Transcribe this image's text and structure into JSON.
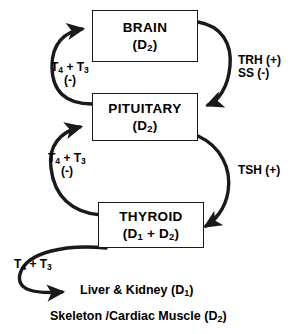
{
  "diagram": {
    "nodes": [
      {
        "id": "brain",
        "label": "BRAIN",
        "deiodinase": "(D2)",
        "deiodinase_base": "(D",
        "deiodinase_sub": "2",
        "deiodinase_tail": ")"
      },
      {
        "id": "pituitary",
        "label": "PITUITARY",
        "deiodinase": "(D2)",
        "deiodinase_base": "(D",
        "deiodinase_sub": "2",
        "deiodinase_tail": ")"
      },
      {
        "id": "thyroid",
        "label": "THYROID",
        "deiodinase": "(D1 + D2)",
        "deiodinase_base": "(D",
        "deiodinase_sub": "1",
        "deiodinase_mid": " + D",
        "deiodinase_sub2": "2",
        "deiodinase_tail": ")"
      }
    ],
    "edges": [
      {
        "id": "brain-feedback",
        "from": "pituitary",
        "to": "brain",
        "hormone_base": "T",
        "hormone_sub1": "4",
        "hormone_mid": " + T",
        "hormone_sub2": "3",
        "hormone": "T4 + T3",
        "sign": "(-)"
      },
      {
        "id": "pituitary-feedback",
        "from": "thyroid",
        "to": "pituitary",
        "hormone_base": "T",
        "hormone_sub1": "4",
        "hormone_mid": " + T",
        "hormone_sub2": "3",
        "hormone": "T4 + T3",
        "sign": "(-)"
      },
      {
        "id": "brain-to-pituitary",
        "from": "brain",
        "to": "pituitary",
        "line1": "TRH (+)",
        "line2": "SS (-)"
      },
      {
        "id": "pituitary-to-thyroid",
        "from": "pituitary",
        "to": "thyroid",
        "line1": "TSH (+)"
      },
      {
        "id": "thyroid-to-periphery",
        "from": "thyroid",
        "to": "peripheral-tissues",
        "hormone_base": "T",
        "hormone_sub1": "4",
        "hormone_mid": " + T",
        "hormone_sub2": "3",
        "hormone": "T4 + T3"
      }
    ],
    "targets": [
      {
        "id": "liver-kidney",
        "base": "Liver & Kidney (D",
        "sub": "1",
        "tail": ")",
        "text": "Liver & Kidney (D1)"
      },
      {
        "id": "skeleton-cardiac",
        "base": "Skeleton /Cardiac Muscle (D",
        "sub": "2",
        "tail": ")",
        "text": "Skeleton /Cardiac Muscle (D2)"
      }
    ],
    "colors": {
      "stroke": "#1a1a1a",
      "text": "#000000",
      "background": "#ffffff"
    }
  }
}
